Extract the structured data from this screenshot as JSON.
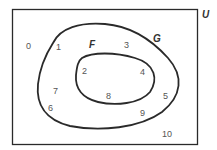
{
  "diagram": {
    "type": "venn",
    "universe_label": "U",
    "sets": [
      {
        "label": "G",
        "description": "outer set"
      },
      {
        "label": "F",
        "description": "inner set, subset of G"
      }
    ],
    "elements": {
      "outside_G": [
        "0",
        "10"
      ],
      "in_G_not_F": [
        "1",
        "3",
        "5",
        "6",
        "7",
        "9"
      ],
      "in_F": [
        "2",
        "4",
        "8"
      ]
    },
    "labels": {
      "n0": "0",
      "n1": "1",
      "n2": "2",
      "n3": "3",
      "n4": "4",
      "n5": "5",
      "n6": "6",
      "n7": "7",
      "n8": "8",
      "n9": "9",
      "n10": "10",
      "F": "F",
      "G": "G",
      "U": "U"
    },
    "colors": {
      "stroke": "#2a2a2a",
      "text": "#555555",
      "background": "#ffffff"
    }
  }
}
